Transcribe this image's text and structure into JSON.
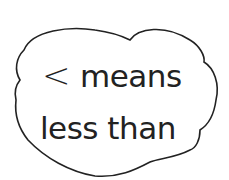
{
  "cloud": {
    "line1": {
      "symbol": "<",
      "text": "means"
    },
    "line2": {
      "text": "less than"
    },
    "stroke_color": "#222222",
    "fill_color": "#ffffff"
  }
}
